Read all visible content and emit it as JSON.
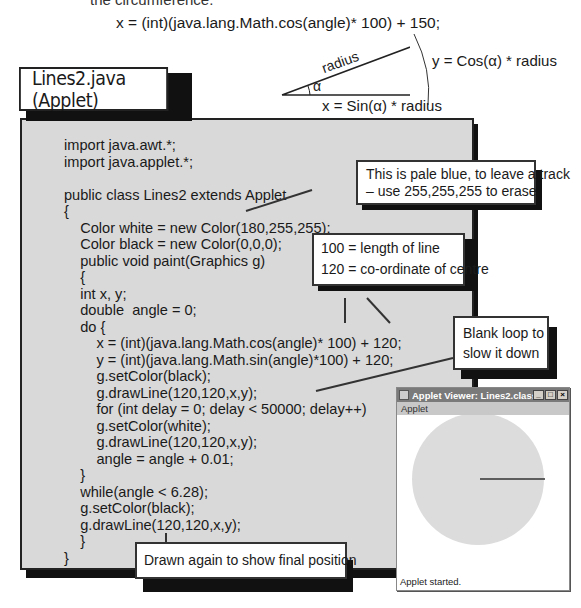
{
  "header": {
    "cropped_caption": "the circumference.",
    "formula": "x = (int)(java.lang.Math.cos(angle)* 100) + 150;"
  },
  "triangle_diagram": {
    "hypotenuse_label": "radius",
    "angle_label": "α",
    "vertical_label": "y = Cos(α) * radius",
    "horizontal_label": "x = Sin(α) * radius"
  },
  "title_box": {
    "label": "Lines2.java (Applet)"
  },
  "code_panel": {
    "lines": [
      "import java.awt.*;",
      "import java.applet.*;",
      "",
      "public class Lines2 extends Applet",
      "{",
      "    Color white = new Color(180,255,255);",
      "    Color black = new Color(0,0,0);",
      "    public void paint(Graphics g)",
      "    {",
      "    int x, y;",
      "    double  angle = 0;",
      "    do {",
      "        x = (int)(java.lang.Math.cos(angle)* 100) + 120;",
      "        y = (int)(java.lang.Math.sin(angle)*100) + 120;",
      "        g.setColor(black);",
      "        g.drawLine(120,120,x,y);",
      "        for (int delay = 0; delay < 50000; delay++)",
      "        g.setColor(white);",
      "        g.drawLine(120,120,x,y);",
      "        angle = angle + 0.01;",
      "    }",
      "    while(angle < 6.28);",
      "    g.setColor(black);",
      "    g.drawLine(120,120,x,y);",
      "    }",
      "}"
    ]
  },
  "callouts": {
    "pale_blue": {
      "line1": "This is pale blue, to leave a track",
      "line2": "– use 255,255,255 to erase"
    },
    "length": {
      "line1": "100 = length of line",
      "line2": "120 = co-ordinate of centre"
    },
    "blank_loop": {
      "line1": "Blank loop to",
      "line2": "slow it down"
    },
    "drawn_again": {
      "line1": "Drawn again to show final position"
    }
  },
  "applet_window": {
    "title": "Applet Viewer: Lines2.class",
    "menu": "Applet",
    "status": "Applet started.",
    "buttons": {
      "minimize": "_",
      "maximize": "□",
      "close": "×"
    },
    "circle_color": "#dcdcdc",
    "line_color": "#333333"
  }
}
